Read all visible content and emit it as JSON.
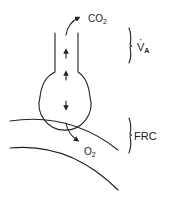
{
  "diagram": {
    "type": "alveolus-gas-exchange",
    "labels": {
      "co2": {
        "main": "CO",
        "sub": "2"
      },
      "o2": {
        "main": "O",
        "sub": "2"
      },
      "va": {
        "main": "V",
        "sub": "A"
      },
      "frc": "FRC"
    },
    "colors": {
      "stroke": "#222222",
      "background": "#ffffff"
    },
    "arrows": [
      {
        "name": "airway-up-arrow-1",
        "direction": "up"
      },
      {
        "name": "airway-up-arrow-2",
        "direction": "up"
      },
      {
        "name": "alveolus-down-arrow",
        "direction": "down"
      },
      {
        "name": "co2-out-arrow",
        "direction": "up-right"
      },
      {
        "name": "o2-in-arrow",
        "direction": "down-right"
      }
    ]
  }
}
